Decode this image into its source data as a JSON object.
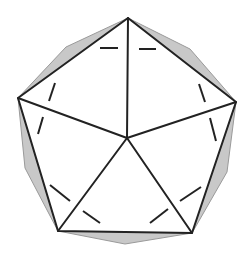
{
  "diagram": {
    "title": "",
    "colors": {
      "background": "#ffffff",
      "edge": "#222222",
      "shade": "#c8c8c8",
      "shade_edge": "#9a9a9a"
    },
    "vertices": {
      "apex": [
        127,
        138
      ],
      "top": [
        128,
        18
      ],
      "right": [
        236,
        102
      ],
      "bottom_right": [
        192,
        233
      ],
      "bottom_left": [
        58,
        231
      ],
      "left": [
        18,
        98
      ]
    },
    "shaded_facets": [
      {
        "name": "upper-left",
        "points": [
          [
            18,
            98
          ],
          [
            66,
            47
          ],
          [
            128,
            18
          ]
        ]
      },
      {
        "name": "upper-right",
        "points": [
          [
            128,
            18
          ],
          [
            190,
            49
          ],
          [
            236,
            102
          ]
        ]
      },
      {
        "name": "right",
        "points": [
          [
            236,
            102
          ],
          [
            227,
            172
          ],
          [
            192,
            233
          ]
        ]
      },
      {
        "name": "bottom",
        "points": [
          [
            192,
            233
          ],
          [
            125,
            244
          ],
          [
            58,
            231
          ]
        ]
      },
      {
        "name": "left",
        "points": [
          [
            58,
            231
          ],
          [
            25,
            168
          ],
          [
            18,
            98
          ]
        ]
      }
    ],
    "dashed_segments": [
      {
        "name": "top-left-dash",
        "from": [
          100,
          48
        ],
        "to": [
          118,
          48
        ]
      },
      {
        "name": "top-right-dash",
        "from": [
          139,
          49
        ],
        "to": [
          156,
          49
        ]
      },
      {
        "name": "upper-left-dash",
        "from": [
          55,
          83
        ],
        "to": [
          49,
          101
        ]
      },
      {
        "name": "lower-left-dash",
        "from": [
          43,
          117
        ],
        "to": [
          38,
          134
        ]
      },
      {
        "name": "upper-right-dash",
        "from": [
          199,
          84
        ],
        "to": [
          205,
          102
        ]
      },
      {
        "name": "lower-right-dash",
        "from": [
          210,
          118
        ],
        "to": [
          216,
          141
        ]
      },
      {
        "name": "bottom-left-dash-1",
        "from": [
          50,
          185
        ],
        "to": [
          70,
          201
        ]
      },
      {
        "name": "bottom-left-dash-2",
        "from": [
          83,
          211
        ],
        "to": [
          100,
          223
        ]
      },
      {
        "name": "bottom-right-dash-1",
        "from": [
          201,
          187
        ],
        "to": [
          180,
          201
        ]
      },
      {
        "name": "bottom-right-dash-2",
        "from": [
          168,
          209
        ],
        "to": [
          150,
          223
        ]
      }
    ]
  }
}
